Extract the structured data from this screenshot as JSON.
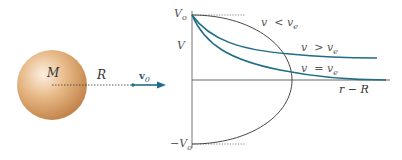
{
  "diagram": {
    "sphere": {
      "label": "M",
      "color": "#d9a06a"
    },
    "radius_label": "R",
    "velocity": {
      "symbol": "v",
      "subscript": "0"
    },
    "graph": {
      "y_axis_label": "V",
      "y_top_tick": {
        "symbol": "V",
        "subscript": "o"
      },
      "y_bottom_tick": {
        "prefix": "−",
        "symbol": "V",
        "subscript": "o"
      },
      "x_axis_label": "r − R",
      "curves": [
        {
          "name": "v < v_e",
          "left": "v",
          "op": "<",
          "right_symbol": "v",
          "right_subscript": "e"
        },
        {
          "name": "v > v_e",
          "left": "v",
          "op": ">",
          "right_symbol": "v",
          "right_subscript": "e"
        },
        {
          "name": "v = v_e",
          "left": "v",
          "op": "=",
          "right_symbol": "v",
          "right_subscript": "e"
        }
      ],
      "curve_color": "#1f6e85",
      "axis_color": "#555555"
    }
  }
}
